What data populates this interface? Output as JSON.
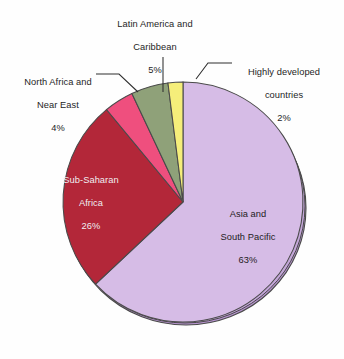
{
  "figure": {
    "background_color": "#ffffff",
    "outline_color": "#4a4a4a"
  },
  "chart_data": {
    "type": "pie",
    "title": "",
    "xlabel": "",
    "ylabel": "",
    "legend_position": "none",
    "grid": false,
    "total": 100,
    "units": "percent",
    "categories": [
      "Asia and South Pacific",
      "Sub-Saharan Africa",
      "North Africa and Near East",
      "Latin America and Caribbean",
      "Highly developed countries"
    ],
    "values": [
      63,
      26,
      4,
      5,
      2
    ],
    "colors": [
      "#d6bce6",
      "#b32739",
      "#ef4f7e",
      "#8fa179",
      "#f5ee7a"
    ],
    "labels": [
      {
        "name": "Asia and South Pacific",
        "value": 63,
        "value_text": "63%",
        "color": "#d6bce6",
        "placement": "inside",
        "text_color": "#1e1b23"
      },
      {
        "name": "Sub-Saharan Africa",
        "value": 26,
        "value_text": "26%",
        "color": "#b32739",
        "placement": "inside",
        "text_color": "#f6eef2"
      },
      {
        "name": "North Africa and Near East",
        "value": 4,
        "value_text": "4%",
        "color": "#ef4f7e",
        "placement": "outside-left",
        "text_color": "#252525"
      },
      {
        "name": "Latin America and Caribbean",
        "value": 5,
        "value_text": "5%",
        "color": "#8fa179",
        "placement": "outside-top",
        "text_color": "#252525"
      },
      {
        "name": "Highly developed countries",
        "value": 2,
        "value_text": "2%",
        "color": "#f5ee7a",
        "placement": "outside-right",
        "text_color": "#252525"
      }
    ]
  },
  "labels": {
    "latin": {
      "line1": "Latin America and",
      "line2": "Caribbean",
      "pct": "5%"
    },
    "highly": {
      "line1": "Highly developed",
      "line2": "countries",
      "pct": "2%"
    },
    "north_africa": {
      "line1": "North Africa and",
      "line2": "Near East",
      "pct": "4%"
    },
    "sub_saharan": {
      "line1": "Sub-Saharan",
      "line2": "Africa",
      "pct": "26%"
    },
    "asia": {
      "line1": "Asia and",
      "line2": "South Pacific",
      "pct": "63%"
    }
  }
}
